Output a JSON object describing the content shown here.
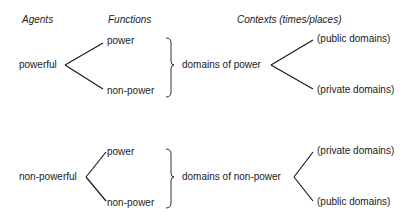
{
  "headers": {
    "agents": "Agents",
    "functions": "Functions",
    "contexts": "Contexts (times/places)"
  },
  "rows": [
    {
      "agent": "powerful",
      "functions": [
        "power",
        "non-power"
      ],
      "domain": "domains of power",
      "contexts": [
        "(public domains)",
        "(private domains)"
      ]
    },
    {
      "agent": "non-powerful",
      "functions": [
        "power",
        "non-power"
      ],
      "domain": "domains of non-power",
      "contexts": [
        "(private domains)",
        "(public domains)"
      ]
    }
  ],
  "colors": {
    "ink": "#1a1a1a",
    "bracket": "#888888"
  }
}
